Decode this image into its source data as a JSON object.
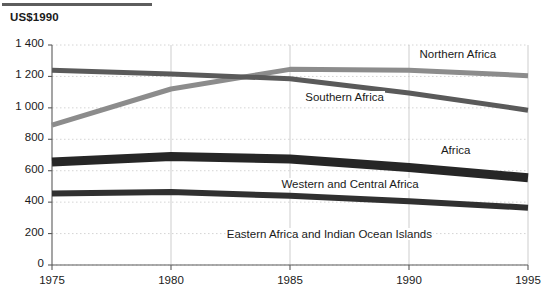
{
  "figure": {
    "unit_title": "US$1990",
    "top_rule": "horizontal-rule"
  },
  "chart_data": {
    "type": "line",
    "title": "",
    "subtitle": "",
    "xlabel": "",
    "ylabel": "US$1990",
    "x": [
      1975,
      1980,
      1985,
      1990,
      1995
    ],
    "xlim": [
      1975,
      1995
    ],
    "ylim": [
      0,
      1400
    ],
    "yticks": [
      0,
      200,
      400,
      600,
      800,
      1000,
      1200,
      1400
    ],
    "ytick_labels": [
      "0",
      "200",
      "400",
      "600",
      "800",
      "1 000",
      "1 200",
      "1 400"
    ],
    "xticks": [
      1975,
      1980,
      1985,
      1990,
      1995
    ],
    "xtick_labels": [
      "1975",
      "1980",
      "1985",
      "1990",
      "1995"
    ],
    "grid": true,
    "legend": "inline-labels",
    "series": [
      {
        "name": "Northern Africa",
        "values": [
          890,
          1120,
          1245,
          1240,
          1205
        ],
        "color": "#8c8c8c",
        "width": 5,
        "label_x": 1990.4,
        "label_y": 1330
      },
      {
        "name": "Southern Africa",
        "values": [
          1240,
          1215,
          1185,
          1095,
          985
        ],
        "color": "#5a5a5a",
        "width": 5,
        "label_x": 1985.6,
        "label_y": 1055
      },
      {
        "name": "Africa",
        "values": [
          655,
          690,
          675,
          620,
          555
        ],
        "color": "#262626",
        "width": 9,
        "label_x": 1991.3,
        "label_y": 720
      },
      {
        "name": "Western and Central Africa",
        "values": [
          455,
          465,
          440,
          405,
          365
        ],
        "color": "#303030",
        "width": 6,
        "label_x": 1984.6,
        "label_y": 505
      },
      {
        "name": "Eastern Africa and Indian Ocean Islands",
        "values": [
          null,
          null,
          null,
          null,
          null
        ],
        "color": "#303030",
        "width": 0,
        "label_x": 1982.3,
        "label_y": 185
      }
    ]
  }
}
